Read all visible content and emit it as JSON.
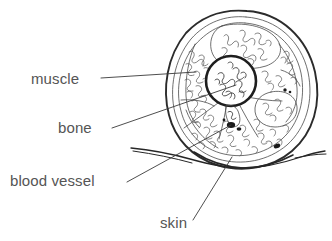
{
  "diagram": {
    "background_color": "#ffffff",
    "ink_color": "#2b2b2b",
    "text_color": "#555555",
    "labels": [
      {
        "id": "muscle",
        "text": "muscle",
        "text_x": 31,
        "text_y": 84,
        "leader": {
          "x1": 101,
          "y1": 78,
          "x2": 196,
          "y2": 72
        }
      },
      {
        "id": "bone",
        "text": "bone",
        "text_x": 58,
        "text_y": 133,
        "leader": {
          "x1": 112,
          "y1": 128,
          "x2": 236,
          "y2": 85
        }
      },
      {
        "id": "blood-vessel",
        "text": "blood vessel",
        "text_x": 10,
        "text_y": 186,
        "leader": {
          "x1": 127,
          "y1": 182,
          "x2": 231,
          "y2": 125
        }
      },
      {
        "id": "skin",
        "text": "skin",
        "text_x": 160,
        "text_y": 228,
        "leader": {
          "x1": 193,
          "y1": 220,
          "x2": 232,
          "y2": 157
        }
      }
    ],
    "structures": [
      {
        "name": "limb-outline",
        "type": "outline"
      },
      {
        "name": "bone-cortex",
        "type": "circle"
      },
      {
        "name": "bone-marrow",
        "type": "texture"
      },
      {
        "name": "muscle-compartments",
        "type": "fascia"
      },
      {
        "name": "muscle-fascicle-texture",
        "type": "texture"
      },
      {
        "name": "skin-flap",
        "type": "sheet"
      },
      {
        "name": "blood-vessel-marks",
        "type": "dots"
      }
    ]
  }
}
